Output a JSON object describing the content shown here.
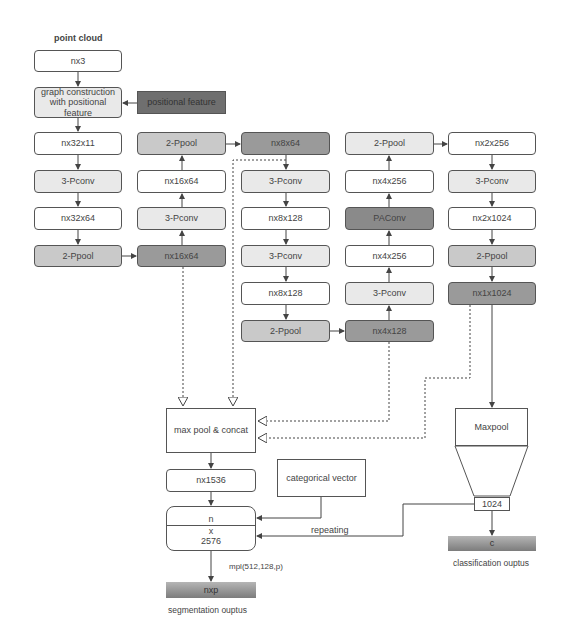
{
  "title": "point cloud",
  "colors": {
    "white": "#ffffff",
    "light": "#e9e9e9",
    "mid": "#c9c9c9",
    "dark": "#9a9a9a",
    "darker": "#6f6f6f",
    "stroke": "#555555"
  },
  "columns": {
    "col1": [
      "nx3",
      "graph construction with positional feature",
      "nx32x11",
      "3-Pconv",
      "nx32x64",
      "2-Ppool"
    ],
    "col2": [
      "2-Ppool",
      "nx16x64",
      "3-Pconv",
      "nx16x64"
    ],
    "col3": [
      "nx8x64",
      "3-Pconv",
      "nx8x128",
      "3-Pconv",
      "nx8x128",
      "2-Ppool"
    ],
    "col4": [
      "2-Ppool",
      "nx4x256",
      "PAConv",
      "nx4x256",
      "3-Pconv",
      "nx4x128"
    ],
    "col5": [
      "nx2x256",
      "3-Pconv",
      "nx2x1024",
      "2-Ppool",
      "nx1x1024"
    ]
  },
  "nodes": {
    "n_nx3": "nx3",
    "graph_line1": "graph construction",
    "graph_line2": "with positional feature",
    "positional_feature": "positional feature",
    "c1_nx32x11": "nx32x11",
    "c1_pconv": "3-Pconv",
    "c1_nx32x64": "nx32x64",
    "c1_ppool": "2-Ppool",
    "c2_ppool": "2-Ppool",
    "c2_nx16x64_top": "nx16x64",
    "c2_pconv": "3-Pconv",
    "c2_nx16x64_bottom": "nx16x64",
    "c3_nx8x64": "nx8x64",
    "c3_pconv1": "3-Pconv",
    "c3_nx8x128_1": "nx8x128",
    "c3_pconv2": "3-Pconv",
    "c3_nx8x128_2": "nx8x128",
    "c3_ppool": "2-Ppool",
    "c4_ppool": "2-Ppool",
    "c4_nx4x256_top": "nx4x256",
    "c4_paconv": "PAConv",
    "c4_nx4x256_bottom": "nx4x256",
    "c4_pconv": "3-Pconv",
    "c4_nx4x128": "nx4x128",
    "c5_nx2x256": "nx2x256",
    "c5_pconv": "3-Pconv",
    "c5_nx2x1024": "nx2x1024",
    "c5_ppool": "2-Ppool",
    "c5_nx1x1024": "nx1x1024",
    "max_pool_concat": "max pool & concat",
    "nx1536": "nx1536",
    "categorical_vector": "categorical vector",
    "concat_top": "n",
    "concat_mid": "x",
    "concat_bottom": "2576",
    "repeating": "repeating",
    "mpl": "mpl(512,128,p)",
    "nxp": "nxp",
    "segmentation_output": "segmentation ouptus",
    "maxpool": "Maxpool",
    "global_1024": "1024",
    "c_out": "c",
    "classification_output": "classification ouptus"
  }
}
